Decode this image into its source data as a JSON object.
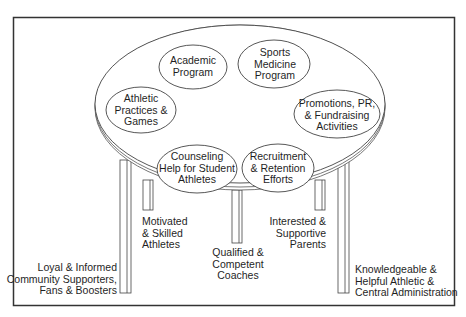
{
  "diagram": {
    "frame": {
      "stroke": "#333333"
    },
    "table_top": {
      "ovals": [
        {
          "id": "academic",
          "label": "Academic\nProgram"
        },
        {
          "id": "sports-medicine",
          "label": "Sports\nMedicine\nProgram"
        },
        {
          "id": "athletic-practices",
          "label": "Athletic\nPractices &\nGames"
        },
        {
          "id": "promotions",
          "label": "Promotions, PR,\n& Fundraising\nActivities"
        },
        {
          "id": "counseling",
          "label": "Counseling\nHelp for Student\nAthletes"
        },
        {
          "id": "recruitment",
          "label": "Recruitment\n& Retention\nEfforts"
        }
      ]
    },
    "legs": [
      {
        "id": "community",
        "label": "Loyal & Informed\nCommunity Supporters,\nFans & Boosters"
      },
      {
        "id": "athletes",
        "label": "Motivated\n& Skilled\nAthletes"
      },
      {
        "id": "coaches",
        "label": "Qualified &\nCompetent\nCoaches"
      },
      {
        "id": "parents",
        "label": "Interested &\nSupportive\nParents"
      },
      {
        "id": "administration",
        "label": "Knowledgeable &\nHelpful Athletic &\nCentral Administration"
      }
    ]
  }
}
